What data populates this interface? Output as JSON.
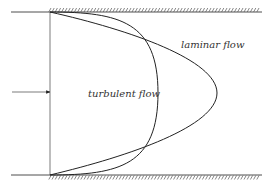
{
  "diagram": {
    "labels": {
      "laminar": "laminar flow",
      "turbulent": "turbulent flow"
    },
    "colors": {
      "line": "#222222",
      "hatch": "#555555",
      "text": "#333333"
    }
  }
}
